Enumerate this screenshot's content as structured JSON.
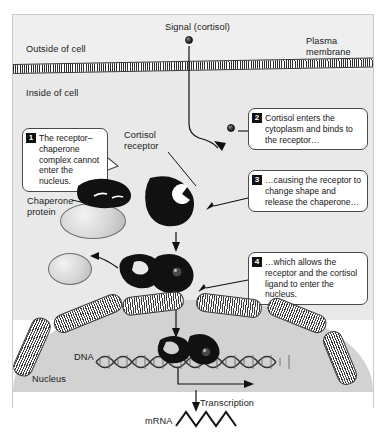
{
  "figure": {
    "title_signal": "Signal (cortisol)",
    "regions": {
      "outside_label": "Outside of cell",
      "inside_label": "Inside of cell",
      "membrane_label": "Plasma\nmembrane",
      "nucleus_label": "Nucleus",
      "dna_label": "DNA",
      "mrna_label": "mRNA",
      "transcription_label": "Transcription"
    },
    "part_labels": {
      "cortisol_receptor": "Cortisol\nreceptor",
      "chaperone_protein": "Chaperone\nprotein"
    },
    "steps": [
      {
        "number": "1",
        "text": "The receptor–chaperone complex cannot enter the nucleus."
      },
      {
        "number": "2",
        "text": "Cortisol enters the cytoplasm and binds to the receptor…"
      },
      {
        "number": "3",
        "text": "…causing the receptor to change shape and release the chaperone…"
      },
      {
        "number": "4",
        "text": "…which allows the receptor and the cortisol ligand to enter the nucleus."
      }
    ],
    "colors": {
      "outside_bg": "#efefef",
      "cytoplasm_bg": "#e9e9e9",
      "nucleus_bg": "#d2d2d2",
      "receptor_fill": "#111111",
      "chaperone_fill": "#d6d6d6",
      "stroke": "#1a1a1a"
    }
  }
}
